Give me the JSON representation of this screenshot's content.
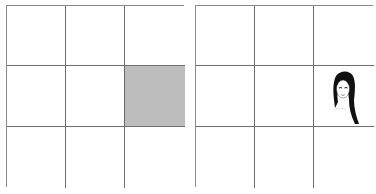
{
  "panels": [
    {
      "name": "left-grid",
      "rows": 3,
      "cols": 3,
      "cells": [
        {
          "row": 1,
          "col": 1,
          "content": "empty"
        },
        {
          "row": 1,
          "col": 2,
          "content": "empty"
        },
        {
          "row": 1,
          "col": 3,
          "content": "empty"
        },
        {
          "row": 2,
          "col": 1,
          "content": "empty"
        },
        {
          "row": 2,
          "col": 2,
          "content": "empty"
        },
        {
          "row": 2,
          "col": 3,
          "content": "shaded",
          "color": "#bdbdbd"
        },
        {
          "row": 3,
          "col": 1,
          "content": "empty"
        },
        {
          "row": 3,
          "col": 2,
          "content": "empty"
        },
        {
          "row": 3,
          "col": 3,
          "content": "empty"
        }
      ]
    },
    {
      "name": "right-grid",
      "rows": 3,
      "cols": 3,
      "cells": [
        {
          "row": 1,
          "col": 1,
          "content": "empty"
        },
        {
          "row": 1,
          "col": 2,
          "content": "empty"
        },
        {
          "row": 1,
          "col": 3,
          "content": "empty"
        },
        {
          "row": 2,
          "col": 1,
          "content": "empty"
        },
        {
          "row": 2,
          "col": 2,
          "content": "empty"
        },
        {
          "row": 2,
          "col": 3,
          "content": "face-image",
          "icon": "woman-face-icon"
        },
        {
          "row": 3,
          "col": 1,
          "content": "empty"
        },
        {
          "row": 3,
          "col": 2,
          "content": "empty"
        },
        {
          "row": 3,
          "col": 3,
          "content": "empty"
        }
      ]
    }
  ],
  "colors": {
    "grid_line": "#6e6e6e",
    "shaded": "#bdbdbd",
    "background": "#ffffff"
  }
}
